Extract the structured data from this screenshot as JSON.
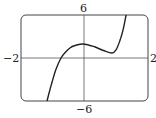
{
  "chart_data": {
    "type": "line",
    "title": "",
    "xlabel": "",
    "ylabel": "",
    "xlim": [
      -2,
      2
    ],
    "ylim": [
      -6,
      6
    ],
    "grid": false,
    "tick_labels": {
      "x_min": "−2",
      "x_max": "2",
      "y_min": "−6",
      "y_max": "6"
    },
    "series": [
      {
        "name": "f(x)",
        "x": [
          -1.18,
          -1.1,
          -1.02,
          -0.9,
          -0.74,
          -0.6,
          -0.46,
          -0.3,
          -0.08,
          0.1,
          0.33,
          0.6,
          0.87,
          1.0,
          1.12,
          1.22,
          1.31
        ],
        "y": [
          -6,
          -4.6,
          -3.35,
          -1.6,
          0,
          0.8,
          1.4,
          1.75,
          1.95,
          1.85,
          1.53,
          1.05,
          0.7,
          1.2,
          2.5,
          4.0,
          6
        ]
      }
    ],
    "legend": null
  },
  "colors": {
    "curve": "#222222",
    "frame": "#444444",
    "axis": "#555555"
  }
}
